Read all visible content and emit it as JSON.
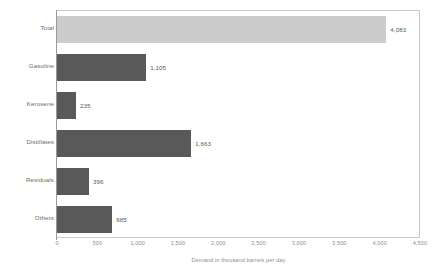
{
  "chart_data": {
    "type": "bar",
    "orientation": "horizontal",
    "title": "",
    "xlabel": "Demand in thousand barrels per day",
    "ylabel": "",
    "xlim": [
      0,
      4500
    ],
    "xticks": [
      "0",
      "500",
      "1,000",
      "1,500",
      "2,000",
      "2,500",
      "3,000",
      "3,500",
      "4,000",
      "4,500"
    ],
    "xtick_values": [
      0,
      500,
      1000,
      1500,
      2000,
      2500,
      3000,
      3500,
      4000,
      4500
    ],
    "grid": false,
    "legend": "none",
    "categories": [
      "Total",
      "Gasoline",
      "Kerosene",
      "Distillates",
      "Residuals",
      "Others"
    ],
    "values": [
      4083,
      1105,
      235,
      1663,
      396,
      685
    ],
    "value_labels": [
      "4,083",
      "1,105",
      "235",
      "1,663",
      "396",
      "685"
    ],
    "bar_colors": [
      "#cccccc",
      "#595959",
      "#595959",
      "#595959",
      "#595959",
      "#595959"
    ],
    "bars": [
      {
        "category": "Total",
        "value": 4083,
        "label": "4,083",
        "color": "#cccccc"
      },
      {
        "category": "Gasoline",
        "value": 1105,
        "label": "1,105",
        "color": "#595959"
      },
      {
        "category": "Kerosene",
        "value": 235,
        "label": "235",
        "color": "#595959"
      },
      {
        "category": "Distillates",
        "value": 1663,
        "label": "1,663",
        "color": "#595959"
      },
      {
        "category": "Residuals",
        "value": 396,
        "label": "396",
        "color": "#595959"
      },
      {
        "category": "Others",
        "value": 685,
        "label": "685",
        "color": "#595959"
      }
    ]
  },
  "colors": {
    "total_bar": "#cccccc",
    "series_bar": "#595959",
    "frame": "#c9c9c9",
    "axis": "#9a9a9a",
    "tick_text": "#8d8d8d",
    "label_text": "#6a6a6a",
    "value_text": "#5a5a5a",
    "background": "#ffffff"
  }
}
